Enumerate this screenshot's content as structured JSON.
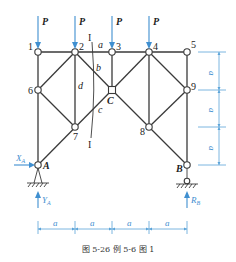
{
  "figure": {
    "caption": "图 5-26   例 5-6 图 1",
    "load_label": "P",
    "dimension_label": "a",
    "section_label": "I",
    "nodes": {
      "n1": "1",
      "n2": "2",
      "n3": "3",
      "n4": "4",
      "n5": "5",
      "n6": "6",
      "n7": "7",
      "n8": "8",
      "n9": "9",
      "C": "C",
      "A": "A",
      "B": "B"
    },
    "member_labels": {
      "a": "a",
      "b": "b",
      "c": "c",
      "d": "d"
    },
    "reactions": {
      "XA": "X",
      "XA_sub": "A",
      "YA": "Y",
      "YA_sub": "A",
      "RB": "R",
      "RB_sub": "B"
    },
    "colors": {
      "force": "#3f8fd0",
      "member": "#3a3a3a",
      "dimension": "#5aa3d8"
    }
  }
}
